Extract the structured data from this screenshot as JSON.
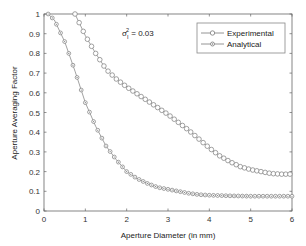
{
  "chart_data": {
    "type": "line",
    "title": "",
    "xlabel": "Aperture Diameter (in mm)",
    "ylabel": "Aperture Averaging Factor",
    "xlim": [
      0,
      6
    ],
    "ylim": [
      0,
      1
    ],
    "xticks": [
      0,
      1,
      2,
      3,
      4,
      5,
      6
    ],
    "xtick_labels": [
      "0",
      "1",
      "2",
      "3",
      "4",
      "5",
      "6"
    ],
    "yticks": [
      0,
      0.1,
      0.2,
      0.3,
      0.4,
      0.5,
      0.6,
      0.7,
      0.8,
      0.9,
      1
    ],
    "ytick_labels": [
      "0",
      "0.1",
      "0.2",
      "0.3",
      "0.4",
      "0.5",
      "0.6",
      "0.7",
      "0.8",
      "0.9",
      "1"
    ],
    "grid": false,
    "legend_position": "upper right",
    "annotation": {
      "symbol": "σ",
      "subscript": "I",
      "superscript": "2",
      "text": " = 0.03"
    },
    "series": [
      {
        "name": "Experimental",
        "marker": "open-circle",
        "color": "#7a7a7a",
        "x": [
          0.75,
          1.0,
          1.25,
          1.5,
          1.75,
          2.0,
          2.25,
          2.5,
          2.75,
          3.0,
          3.25,
          3.5,
          3.75,
          4.0,
          4.25,
          4.5,
          4.75,
          5.0,
          5.25,
          5.5,
          5.75,
          6.0
        ],
        "values": [
          1.0,
          0.89,
          0.8,
          0.72,
          0.67,
          0.63,
          0.595,
          0.56,
          0.525,
          0.49,
          0.45,
          0.41,
          0.365,
          0.32,
          0.28,
          0.25,
          0.225,
          0.21,
          0.2,
          0.19,
          0.187,
          0.187
        ]
      },
      {
        "name": "Analytical",
        "marker": "dotted-circle",
        "color": "#7a7a7a",
        "x": [
          0.1,
          0.25,
          0.5,
          0.75,
          1.0,
          1.25,
          1.5,
          1.75,
          2.0,
          2.25,
          2.5,
          2.75,
          3.0,
          3.25,
          3.5,
          3.75,
          4.0,
          4.5,
          5.0,
          5.5,
          6.0
        ],
        "values": [
          1.0,
          0.97,
          0.86,
          0.71,
          0.55,
          0.43,
          0.33,
          0.26,
          0.2,
          0.165,
          0.14,
          0.12,
          0.11,
          0.1,
          0.09,
          0.083,
          0.08,
          0.077,
          0.075,
          0.075,
          0.075
        ]
      }
    ]
  },
  "legend": {
    "items": [
      {
        "label": "Experimental"
      },
      {
        "label": "Analytical"
      }
    ]
  },
  "axes": {
    "xlabel": "Aperture Diameter (in mm)",
    "ylabel": "Aperture Averaging Factor"
  },
  "annotation": {
    "sigma": "σ",
    "sub": "I",
    "sup": "2",
    "rest": " = 0.03"
  }
}
